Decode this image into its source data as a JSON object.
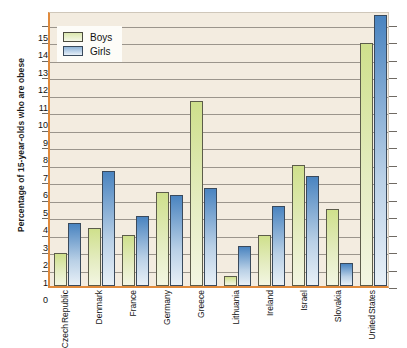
{
  "chart_data": {
    "type": "bar",
    "title": "",
    "xlabel": "",
    "ylabel": "Percentage of 15-year-olds who are obese",
    "ylim": [
      0,
      15.8
    ],
    "yticks": [
      0,
      1,
      2,
      3,
      4,
      5,
      6,
      7,
      8,
      9,
      10,
      11,
      12,
      13,
      14,
      15
    ],
    "ytick_labels": [
      "0",
      "1",
      "2",
      "3",
      "4",
      "5",
      "6",
      "7",
      "8",
      "9",
      "10",
      "11",
      "12",
      "13",
      "14",
      "15"
    ],
    "grid": true,
    "legend_position": "top-left",
    "categories": [
      "Czech Republic",
      "Denmark",
      "France",
      "Germany",
      "Greece",
      "Lithuania",
      "Ireland",
      "Israel",
      "Slovakia",
      "United States"
    ],
    "category_lines": [
      [
        "Czech",
        "Republic"
      ],
      [
        "Denmark"
      ],
      [
        "France"
      ],
      [
        "Germany"
      ],
      [
        "Greece"
      ],
      [
        "Lithuania"
      ],
      [
        "Ireland"
      ],
      [
        "Israel"
      ],
      [
        "Slovakia"
      ],
      [
        "United",
        "States"
      ]
    ],
    "series": [
      {
        "name": "Boys",
        "color": "#d5e396",
        "values": [
          1.9,
          3.3,
          2.9,
          5.4,
          10.6,
          0.6,
          2.9,
          6.9,
          4.4,
          13.9
        ]
      },
      {
        "name": "Girls",
        "color": "#5a8fc4",
        "values": [
          3.6,
          6.6,
          4.0,
          5.2,
          5.6,
          2.3,
          4.6,
          6.3,
          1.3,
          15.5
        ]
      }
    ]
  },
  "legend": {
    "items": [
      {
        "label": "Boys"
      },
      {
        "label": "Girls"
      }
    ]
  }
}
